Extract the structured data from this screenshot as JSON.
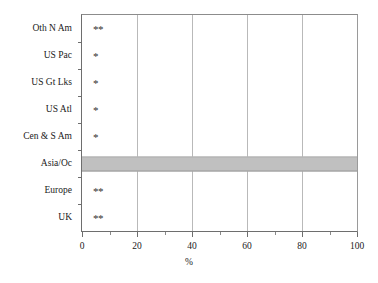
{
  "chart_data": {
    "type": "bar",
    "orientation": "horizontal",
    "title": "",
    "subtitle": "",
    "xlabel": "%",
    "ylabel": "",
    "xlim": [
      0,
      100
    ],
    "xticks": [
      0,
      20,
      40,
      60,
      80,
      100
    ],
    "xticklabels": [
      "0",
      "20",
      "40",
      "60",
      "80",
      "100"
    ],
    "xminorticks": [
      10,
      30,
      50,
      70,
      90
    ],
    "grid": "vertical",
    "legend": "none",
    "categories": [
      "Oth N Am",
      "US Pac",
      "US Gt Lks",
      "US Atl",
      "Cen & S Am",
      "Asia/Oc",
      "Europe",
      "UK"
    ],
    "values": [
      0,
      0,
      0,
      0,
      0,
      100,
      0,
      0
    ],
    "annotations": [
      {
        "category": "Oth N Am",
        "text": "**",
        "x": 4
      },
      {
        "category": "US Pac",
        "text": "*",
        "x": 4
      },
      {
        "category": "US Gt Lks",
        "text": "*",
        "x": 4
      },
      {
        "category": "US Atl",
        "text": "*",
        "x": 4
      },
      {
        "category": "Cen & S Am",
        "text": "*",
        "x": 4
      },
      {
        "category": "Europe",
        "text": "**",
        "x": 4
      },
      {
        "category": "UK",
        "text": "**",
        "x": 4
      }
    ],
    "bar_fill": "#808080",
    "bar_pattern": "checker-hatch",
    "grid_color": "#b9b9b9",
    "axis_color": "#6e6e6e"
  }
}
